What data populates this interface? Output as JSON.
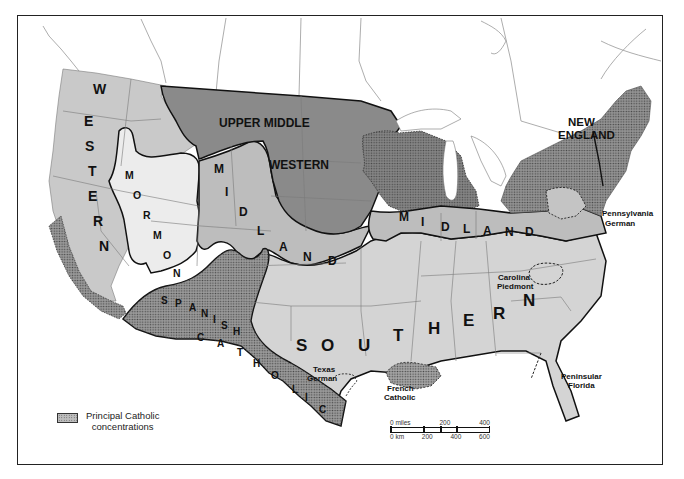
{
  "map": {
    "title": "Cultural regions of the United States",
    "colors": {
      "background": "#ffffff",
      "western": "#c9c9c9",
      "mormon": "#ececec",
      "midland": "#bdbdbd",
      "upper_middle_western": "#8a8a8a",
      "southern": "#d4d4d4",
      "new_england": "#939393",
      "catholic_hatch": "#555555",
      "border": "#111111",
      "state_line": "#7a7a7a"
    },
    "regions": [
      {
        "id": "western",
        "label": "WESTERN"
      },
      {
        "id": "mormon",
        "label": "MORMON"
      },
      {
        "id": "upper_middle_western",
        "label_line1": "UPPER MIDDLE",
        "label_line2": "WESTERN"
      },
      {
        "id": "midland",
        "label": "MIDLAND"
      },
      {
        "id": "midland_east",
        "label": "MIDLAND"
      },
      {
        "id": "new_england",
        "label_line1": "NEW",
        "label_line2": "ENGLAND"
      },
      {
        "id": "southern",
        "label": "SOUTHERN"
      },
      {
        "id": "spanish_catholic",
        "label_line1": "SPANISH",
        "label_line2": "CATHOLIC"
      }
    ],
    "subregions": [
      {
        "id": "pennsylvania_german",
        "line1": "Pennsylvania",
        "line2": "German"
      },
      {
        "id": "carolina_piedmont",
        "line1": "Carolina",
        "line2": "Piedmont"
      },
      {
        "id": "texas_german",
        "line1": "Texas",
        "line2": "German"
      },
      {
        "id": "french_catholic",
        "line1": "French",
        "line2": "Catholic"
      },
      {
        "id": "peninsular_florida",
        "line1": "Peninsular",
        "line2": "Florida"
      }
    ]
  },
  "legend": {
    "swatch": "hatched-pattern",
    "line1": "Principal Catholic",
    "line2": "concentrations"
  },
  "scale": {
    "miles_labels": [
      "0 miles",
      "200",
      "400"
    ],
    "km_labels": [
      "0 km",
      "200",
      "400",
      "600"
    ]
  }
}
